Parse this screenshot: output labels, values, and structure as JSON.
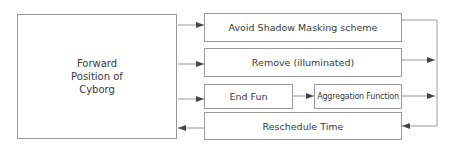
{
  "diagram": {
    "main_box": {
      "lines": [
        "Forward",
        "Position of",
        "Cyborg"
      ]
    },
    "boxes": [
      {
        "id": "avoid-shadow",
        "label": "Avoid Shadow Masking scheme"
      },
      {
        "id": "remove",
        "label": "Remove (illuminated)"
      },
      {
        "id": "end-fun",
        "label": "End Fun"
      },
      {
        "id": "aggregation",
        "label": "Aggregation Function"
      },
      {
        "id": "reschedule",
        "label": "Reschedule Time"
      }
    ],
    "edges": [
      {
        "from": "Forward Position of Cyborg",
        "to": "Avoid Shadow Masking scheme"
      },
      {
        "from": "Forward Position of Cyborg",
        "to": "Remove (illuminated)"
      },
      {
        "from": "Forward Position of Cyborg",
        "to": "End Fun"
      },
      {
        "from": "End Fun",
        "to": "Aggregation Function"
      },
      {
        "from": "Avoid Shadow Masking scheme",
        "to": "right bus"
      },
      {
        "from": "Remove (illuminated)",
        "to": "right bus"
      },
      {
        "from": "Aggregation Function",
        "to": "right bus"
      },
      {
        "from": "right bus",
        "to": "Reschedule Time"
      },
      {
        "from": "Reschedule Time",
        "to": "Forward Position of Cyborg"
      }
    ],
    "colors": {
      "line": "#9a9a9a",
      "arrow": "#444444",
      "text": "#3a3a3a"
    }
  }
}
